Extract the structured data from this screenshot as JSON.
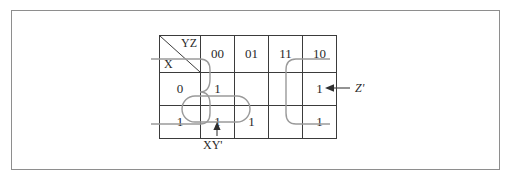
{
  "figure": {
    "type": "karnaugh-map",
    "variables": [
      "X",
      "Y",
      "Z"
    ],
    "row_variable_label": "X",
    "column_variable_label": "YZ"
  },
  "kmap": {
    "column_headers": [
      "00",
      "01",
      "11",
      "10"
    ],
    "row_headers": [
      "0",
      "1"
    ],
    "rows": [
      {
        "header": "0",
        "cells": [
          "1",
          "",
          "",
          "1"
        ]
      },
      {
        "header": "1",
        "cells": [
          "1",
          "1",
          "",
          "1"
        ]
      }
    ]
  },
  "annotations": [
    {
      "name": "z-prime",
      "label": "Z'",
      "arrow": "left",
      "describes": "wrap-around group of column 00 and column 10 across both rows"
    },
    {
      "name": "xy-prime",
      "label": "XY'",
      "arrow": "up",
      "describes": "group of row 1 cells in columns 00 and 01"
    }
  ],
  "colors": {
    "grid_line": "#3b3b3b",
    "group_line": "#9a9a9a",
    "frame": "#8e8e8e",
    "text": "#2a2a2a",
    "arrow": "#2f2f2f",
    "background": "#ffffff"
  }
}
